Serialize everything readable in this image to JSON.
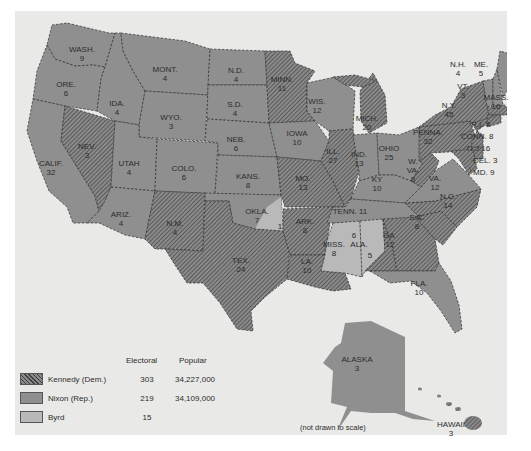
{
  "map": {
    "title_visible": false,
    "note": "(not drawn to scale)",
    "colors": {
      "background": "#e9e9e7",
      "nixon": "#8f8f8f",
      "kennedy_base": "#8a8a8a",
      "kennedy_hatch": "#4a4a4a",
      "byrd": "#b9b9b9",
      "border": "#2e2e2e",
      "label": "#2c2c2c"
    },
    "states": [
      {
        "abbr": "WASH.",
        "ev": "9",
        "winner": "Nixon"
      },
      {
        "abbr": "ORE.",
        "ev": "6",
        "winner": "Nixon"
      },
      {
        "abbr": "CALIF.",
        "ev": "32",
        "winner": "Nixon"
      },
      {
        "abbr": "IDA.",
        "ev": "4",
        "winner": "Nixon"
      },
      {
        "abbr": "NEV.",
        "ev": "3",
        "winner": "Kennedy"
      },
      {
        "abbr": "MONT.",
        "ev": "4",
        "winner": "Nixon"
      },
      {
        "abbr": "WYO.",
        "ev": "3",
        "winner": "Nixon"
      },
      {
        "abbr": "UTAH",
        "ev": "4",
        "winner": "Nixon"
      },
      {
        "abbr": "ARIZ.",
        "ev": "4",
        "winner": "Nixon"
      },
      {
        "abbr": "COLO.",
        "ev": "6",
        "winner": "Nixon"
      },
      {
        "abbr": "N.M.",
        "ev": "4",
        "winner": "Kennedy"
      },
      {
        "abbr": "N.D.",
        "ev": "4",
        "winner": "Nixon"
      },
      {
        "abbr": "S.D.",
        "ev": "4",
        "winner": "Nixon"
      },
      {
        "abbr": "NEB.",
        "ev": "6",
        "winner": "Nixon"
      },
      {
        "abbr": "KANS.",
        "ev": "8",
        "winner": "Nixon"
      },
      {
        "abbr": "OKLA.",
        "ev": "7",
        "winner": "Nixon"
      },
      {
        "abbr": "OKLA. (Byrd)",
        "ev": "1",
        "winner": "Byrd"
      },
      {
        "abbr": "TEX.",
        "ev": "24",
        "winner": "Kennedy"
      },
      {
        "abbr": "MINN.",
        "ev": "11",
        "winner": "Kennedy"
      },
      {
        "abbr": "IOWA",
        "ev": "10",
        "winner": "Nixon"
      },
      {
        "abbr": "MO.",
        "ev": "13",
        "winner": "Kennedy"
      },
      {
        "abbr": "ARK.",
        "ev": "8",
        "winner": "Kennedy"
      },
      {
        "abbr": "LA.",
        "ev": "10",
        "winner": "Kennedy"
      },
      {
        "abbr": "WIS.",
        "ev": "12",
        "winner": "Nixon"
      },
      {
        "abbr": "ILL.",
        "ev": "27",
        "winner": "Kennedy"
      },
      {
        "abbr": "MICH.",
        "ev": "20",
        "winner": "Kennedy"
      },
      {
        "abbr": "IND.",
        "ev": "13",
        "winner": "Nixon"
      },
      {
        "abbr": "OHIO",
        "ev": "25",
        "winner": "Nixon"
      },
      {
        "abbr": "KY",
        "ev": "10",
        "winner": "Nixon"
      },
      {
        "abbr": "TENN.",
        "ev": "11",
        "winner": "Nixon"
      },
      {
        "abbr": "MISS.",
        "ev": "8",
        "winner": "Byrd"
      },
      {
        "abbr": "ALA. (Byrd)",
        "ev": "6",
        "winner": "Byrd"
      },
      {
        "abbr": "ALA.",
        "ev": "5",
        "winner": "Kennedy"
      },
      {
        "abbr": "GA.",
        "ev": "12",
        "winner": "Kennedy"
      },
      {
        "abbr": "FLA.",
        "ev": "10",
        "winner": "Nixon"
      },
      {
        "abbr": "S.C.",
        "ev": "8",
        "winner": "Kennedy"
      },
      {
        "abbr": "N.C.",
        "ev": "14",
        "winner": "Kennedy"
      },
      {
        "abbr": "VA.",
        "ev": "12",
        "winner": "Nixon"
      },
      {
        "abbr": "W. VA.",
        "ev": "8",
        "winner": "Kennedy"
      },
      {
        "abbr": "PENNA.",
        "ev": "32",
        "winner": "Kennedy"
      },
      {
        "abbr": "N.Y.",
        "ev": "45",
        "winner": "Kennedy"
      },
      {
        "abbr": "VT.",
        "ev": "3",
        "winner": "Nixon"
      },
      {
        "abbr": "N.H.",
        "ev": "4",
        "winner": "Nixon"
      },
      {
        "abbr": "ME.",
        "ev": "5",
        "winner": "Nixon"
      },
      {
        "abbr": "MASS.",
        "ev": "16",
        "winner": "Kennedy"
      },
      {
        "abbr": "R.I.",
        "ev": "4",
        "winner": "Kennedy"
      },
      {
        "abbr": "CONN.",
        "ev": "8",
        "winner": "Kennedy"
      },
      {
        "abbr": "N.J.",
        "ev": "16",
        "winner": "Kennedy"
      },
      {
        "abbr": "DEL.",
        "ev": "3",
        "winner": "Kennedy"
      },
      {
        "abbr": "MD.",
        "ev": "9",
        "winner": "Kennedy"
      },
      {
        "abbr": "ALASKA",
        "ev": "3",
        "winner": "Nixon"
      },
      {
        "abbr": "HAWAII",
        "ev": "3",
        "winner": "Kennedy"
      }
    ],
    "labels": {
      "wash": {
        "name": "WASH.",
        "ev": "9"
      },
      "ore": {
        "name": "ORE.",
        "ev": "6"
      },
      "calif": {
        "name": "CALIF.",
        "ev": "32"
      },
      "ida": {
        "name": "IDA.",
        "ev": "4"
      },
      "nev": {
        "name": "NEV.",
        "ev": "3"
      },
      "mont": {
        "name": "MONT.",
        "ev": "4"
      },
      "wyo": {
        "name": "WYO.",
        "ev": "3"
      },
      "utah": {
        "name": "UTAH",
        "ev": "4"
      },
      "ariz": {
        "name": "ARIZ.",
        "ev": "4"
      },
      "colo": {
        "name": "COLO.",
        "ev": "6"
      },
      "nm": {
        "name": "N.M.",
        "ev": "4"
      },
      "nd": {
        "name": "N.D.",
        "ev": "4"
      },
      "sd": {
        "name": "S.D.",
        "ev": "4"
      },
      "neb": {
        "name": "NEB.",
        "ev": "6"
      },
      "kans": {
        "name": "KANS.",
        "ev": "8"
      },
      "okla": {
        "name": "OKLA.",
        "ev": "7"
      },
      "okla_byrd": {
        "ev": "1"
      },
      "tex": {
        "name": "TEX.",
        "ev": "24"
      },
      "minn": {
        "name": "MINN.",
        "ev": "11"
      },
      "iowa": {
        "name": "IOWA",
        "ev": "10"
      },
      "mo": {
        "name": "MO.",
        "ev": "13"
      },
      "ark": {
        "name": "ARK.",
        "ev": "8"
      },
      "la": {
        "name": "LA.",
        "ev": "10"
      },
      "wis": {
        "name": "WIS.",
        "ev": "12"
      },
      "ill": {
        "name": "ILL.",
        "ev": "27"
      },
      "mich": {
        "name": "MICH.",
        "ev": "20"
      },
      "ind": {
        "name": "IND.",
        "ev": "13"
      },
      "ohio": {
        "name": "OHIO",
        "ev": "25"
      },
      "ky": {
        "name": "KY",
        "ev": "10"
      },
      "tenn": {
        "name": "TENN.   11"
      },
      "miss": {
        "name": "MISS.",
        "ev": "8"
      },
      "ala_byrd": {
        "ev": "6"
      },
      "ala": {
        "name": "ALA.",
        "ev": "5"
      },
      "ga": {
        "name": "GA.",
        "ev": "12"
      },
      "fla": {
        "name": "FLA.",
        "ev": "10"
      },
      "sc": {
        "name": "S.C.",
        "ev": "8"
      },
      "nc": {
        "name": "N.C.",
        "ev": "14"
      },
      "va": {
        "name": "VA.",
        "ev": "12"
      },
      "wva": {
        "name1": "W.",
        "name2": "VA.",
        "ev": "8"
      },
      "penna": {
        "name": "PENNA.",
        "ev": "32"
      },
      "ny": {
        "name": "N.Y.",
        "ev": "45"
      },
      "vt": {
        "name": "VT.",
        "ev": "3"
      },
      "nh": {
        "name": "N.H.",
        "ev": "4"
      },
      "me": {
        "name": "ME.",
        "ev": "5"
      },
      "mass": {
        "name": "MASS.",
        "ev": "16"
      },
      "ri": {
        "name": "R.I. 4"
      },
      "conn": {
        "name": "CONN. 8"
      },
      "nj": {
        "name": "N.J.16"
      },
      "del": {
        "name": "DEL. 3"
      },
      "md": {
        "name": "MD. 9"
      },
      "alaska": {
        "name": "ALASKA",
        "ev": "3"
      },
      "hawaii": {
        "name": "HAWAII",
        "ev": "3"
      }
    }
  },
  "legend": {
    "headers": {
      "electoral": "Electoral",
      "popular": "Popular"
    },
    "rows": [
      {
        "candidate": "Kennedy (Dem.)",
        "electoral": "303",
        "popular": "34,227,000",
        "swatch": "hatched"
      },
      {
        "candidate": "Nixon (Rep.)",
        "electoral": "219",
        "popular": "34,109,000",
        "swatch": "dark-gray"
      },
      {
        "candidate": "Byrd",
        "electoral": "15",
        "popular": "",
        "swatch": "light-gray"
      }
    ]
  }
}
